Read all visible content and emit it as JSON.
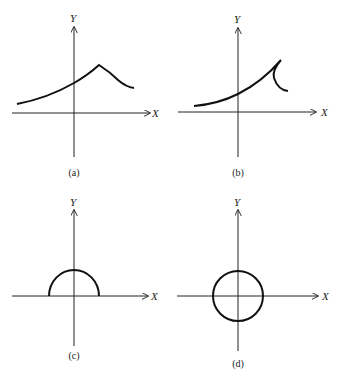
{
  "figure": {
    "panels": [
      {
        "id": "a",
        "caption": "(a)",
        "x_label": "X",
        "y_label": "Y",
        "description": "Curve rising from left, peak to right of Y-axis, then falling (function graph)"
      },
      {
        "id": "b",
        "caption": "(b)",
        "x_label": "X",
        "y_label": "Y",
        "description": "Curve rising to a cusp then turning back down and right (not a function)"
      },
      {
        "id": "c",
        "caption": "(c)",
        "x_label": "X",
        "y_label": "Y",
        "description": "Upper semicircle centered at origin"
      },
      {
        "id": "d",
        "caption": "(d)",
        "x_label": "X",
        "y_label": "Y",
        "description": "Full circle centered at origin"
      }
    ]
  }
}
